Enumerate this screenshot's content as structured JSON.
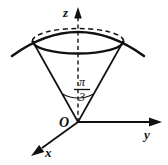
{
  "figure": {
    "background_color": "#ffffff",
    "stroke_color": "#111111",
    "axes": [
      {
        "name": "z-axis",
        "label": "z",
        "direction": "up",
        "line_style": "dashed",
        "arrow": true
      },
      {
        "name": "y-axis",
        "label": "y",
        "direction": "right",
        "line_style": "solid",
        "arrow": true
      },
      {
        "name": "x-axis",
        "label": "x",
        "direction": "down-left",
        "line_style": "solid",
        "arrow": true
      }
    ],
    "origin": {
      "label": "O"
    },
    "angle": {
      "name": "cone-half-angle",
      "numerator": "π",
      "denominator": "3",
      "display": "π/3",
      "measured_from": "z-axis"
    },
    "shapes": [
      {
        "name": "cone",
        "description": "cone with apex at origin opening upward"
      },
      {
        "name": "sphere-cap-arc",
        "description": "spherical surface arc capping the cone"
      },
      {
        "name": "intersection-ellipse",
        "description": "circle of intersection drawn as ellipse, back half dashed"
      }
    ]
  }
}
